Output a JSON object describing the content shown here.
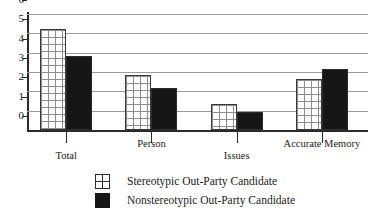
{
  "chart_data": {
    "type": "bar",
    "title": "",
    "xlabel": "",
    "ylabel": "",
    "ylim": [
      0,
      6
    ],
    "yticks": [
      0,
      1,
      2,
      3,
      4,
      5,
      6
    ],
    "grid": true,
    "legend_position": "bottom",
    "categories": [
      "Total",
      "Person",
      "Issues",
      "Accurate Memory"
    ],
    "series": [
      {
        "name": "Stereotypic Out-Party Candidate",
        "style": "white-crosshatch",
        "values": [
          5.2,
          2.85,
          1.35,
          2.65
        ]
      },
      {
        "name": "Nonstereotypic Out-Party Candidate",
        "style": "solid-black",
        "values": [
          3.85,
          2.15,
          0.95,
          3.15
        ]
      }
    ]
  },
  "legend": {
    "items": [
      {
        "label": "Stereotypic Out-Party Candidate",
        "swatch": "light-crosshatch-swatch"
      },
      {
        "label": "Nonstereotypic Out-Party Candidate",
        "swatch": "dark-solid-swatch"
      }
    ]
  },
  "colors": {
    "series_light_fill": "#ffffff",
    "series_light_border": "#3a3a3a",
    "series_light_hatch": "#8e8e8e",
    "series_dark_fill": "#161616",
    "axis": "#2b2b2b",
    "gridline": "#9b9b9b",
    "text": "#1a1a1a",
    "background": "#ffffff"
  }
}
